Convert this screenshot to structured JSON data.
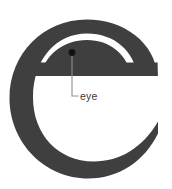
{
  "figure": {
    "type": "typography-anatomy-diagram",
    "background_color": "#ffffff",
    "glyph": {
      "character": "e",
      "name": "lowercase-letter-e",
      "color": "#3f3f3f"
    },
    "annotations": [
      {
        "label": "eye",
        "target": "counter-of-e",
        "marker": "filled-dot",
        "marker_color": "#111111",
        "leader_color": "#8a8a8a",
        "text_color": "#3b3b3b"
      }
    ]
  }
}
